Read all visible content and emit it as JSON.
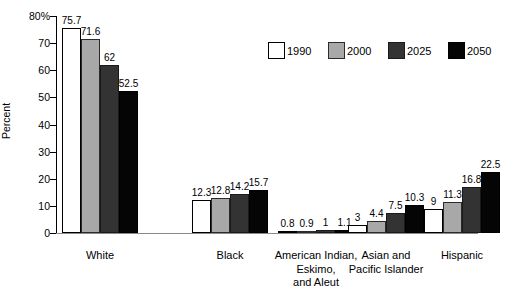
{
  "chart_data": {
    "type": "bar",
    "title": "",
    "xlabel": "",
    "ylabel": "Percent",
    "ylim": [
      0,
      80
    ],
    "grid": false,
    "legend_position": "top-right",
    "categories": [
      "White",
      "Black",
      "American Indian,\nEskimo,\nand Aleut",
      "Asian and\nPacific Islander",
      "Hispanic"
    ],
    "y_ticks": [
      "0",
      "10",
      "20",
      "30",
      "40",
      "50",
      "60",
      "70",
      "80%"
    ],
    "y_tick_values": [
      0,
      10,
      20,
      30,
      40,
      50,
      60,
      70,
      80
    ],
    "series": [
      {
        "name": "1990",
        "color": "#ffffff",
        "values": [
          75.7,
          12.3,
          0.8,
          3,
          9
        ],
        "labels": [
          "75.7",
          "12.3",
          "0.8",
          "3",
          "9"
        ]
      },
      {
        "name": "2000",
        "color": "#a8a8a8",
        "values": [
          71.6,
          12.8,
          0.9,
          4.4,
          11.3
        ],
        "labels": [
          "71.6",
          "12.8",
          "0.9",
          "4.4",
          "11.3"
        ]
      },
      {
        "name": "2025",
        "color": "#333333",
        "values": [
          62,
          14.2,
          1,
          7.5,
          16.8
        ],
        "labels": [
          "62",
          "14.2",
          "1",
          "7.5",
          "16.8"
        ]
      },
      {
        "name": "2050",
        "color": "#050505",
        "values": [
          52.5,
          15.7,
          1.1,
          10.3,
          22.5
        ],
        "labels": [
          "52.5",
          "15.7",
          "1.1",
          "10.3",
          "22.5"
        ]
      }
    ]
  },
  "legend": {
    "items": [
      {
        "label": "1990"
      },
      {
        "label": "2000"
      },
      {
        "label": "2025"
      },
      {
        "label": "2050"
      }
    ]
  }
}
